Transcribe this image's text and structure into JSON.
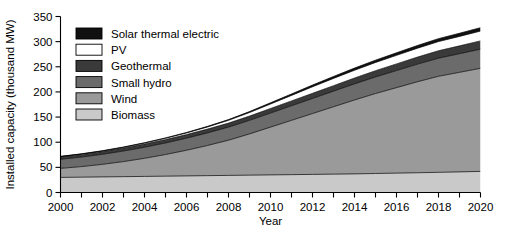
{
  "chart_data": {
    "type": "area",
    "stacked": true,
    "title": "",
    "xlabel": "Year",
    "ylabel": "Installed capacity (thousand MW)",
    "x": [
      2000,
      2001,
      2002,
      2003,
      2004,
      2005,
      2006,
      2007,
      2008,
      2009,
      2010,
      2011,
      2012,
      2013,
      2014,
      2015,
      2016,
      2017,
      2018,
      2019,
      2020
    ],
    "xlim": [
      2000,
      2020
    ],
    "ylim": [
      0,
      350
    ],
    "xticks": [
      2000,
      2002,
      2004,
      2006,
      2008,
      2010,
      2012,
      2014,
      2016,
      2018,
      2020
    ],
    "xtick_labels": [
      "2000",
      "2002",
      "2004",
      "2006",
      "2008",
      "2010",
      "2012",
      "2014",
      "2016",
      "2018",
      "2020"
    ],
    "x_minor_ticks": [
      2001,
      2003,
      2005,
      2007,
      2009,
      2011,
      2013,
      2015,
      2017,
      2019
    ],
    "yticks": [
      0,
      50,
      100,
      150,
      200,
      250,
      300,
      350
    ],
    "ytick_labels": [
      "0",
      "50",
      "100",
      "150",
      "200",
      "250",
      "300",
      "350"
    ],
    "grid": false,
    "legend_position": "upper-left-inside",
    "series": [
      {
        "name": "Biomass",
        "color": "#c9c9c9",
        "values": [
          30,
          30.5,
          31,
          31.5,
          32,
          32.5,
          33,
          33.5,
          34,
          34.5,
          35,
          35.5,
          36,
          36.5,
          37,
          37.8,
          38.5,
          39.3,
          40.1,
          41,
          42
        ]
      },
      {
        "name": "Wind",
        "color": "#9a9a9a",
        "values": [
          18,
          21,
          25,
          30,
          36,
          43,
          51,
          60,
          70,
          82,
          95,
          108,
          121,
          134,
          147,
          159,
          170,
          181,
          191,
          198,
          205
        ]
      },
      {
        "name": "Small hydro",
        "color": "#6b6b6b",
        "values": [
          18,
          19,
          20,
          21,
          22,
          23,
          24,
          25,
          26,
          27,
          28,
          29,
          30,
          31,
          32,
          33,
          34,
          35,
          36,
          37,
          38
        ]
      },
      {
        "name": "Geothermal",
        "color": "#3a3a3a",
        "values": [
          5,
          5.3,
          5.6,
          6,
          6.4,
          6.8,
          7.2,
          7.6,
          8,
          8.5,
          9,
          9.6,
          10.2,
          10.9,
          11.6,
          12.4,
          13.2,
          14,
          14.8,
          15.6,
          16.5
        ]
      },
      {
        "name": "PV",
        "color": "#ffffff",
        "values": [
          0.5,
          0.7,
          1,
          1.4,
          1.9,
          2.5,
          3.2,
          4.2,
          5.5,
          7,
          9,
          11,
          13,
          14.5,
          15.5,
          16.3,
          17,
          17.6,
          18.2,
          18.8,
          19.5
        ]
      },
      {
        "name": "Solar thermal electric",
        "color": "#111111",
        "values": [
          0.4,
          0.45,
          0.5,
          0.6,
          0.7,
          0.8,
          1,
          1.2,
          1.5,
          1.9,
          2.4,
          2.9,
          3.4,
          3.9,
          4.3,
          4.7,
          5.1,
          5.5,
          5.9,
          6.3,
          6.8
        ]
      }
    ],
    "totals_note": "",
    "legend_entries": [
      {
        "label": "Solar thermal electric",
        "swatch": "#111111"
      },
      {
        "label": "PV",
        "swatch": "#ffffff"
      },
      {
        "label": "Geothermal",
        "swatch": "#3a3a3a"
      },
      {
        "label": "Small hydro",
        "swatch": "#6b6b6b"
      },
      {
        "label": "Wind",
        "swatch": "#9a9a9a"
      },
      {
        "label": "Biomass",
        "swatch": "#c9c9c9"
      }
    ]
  }
}
